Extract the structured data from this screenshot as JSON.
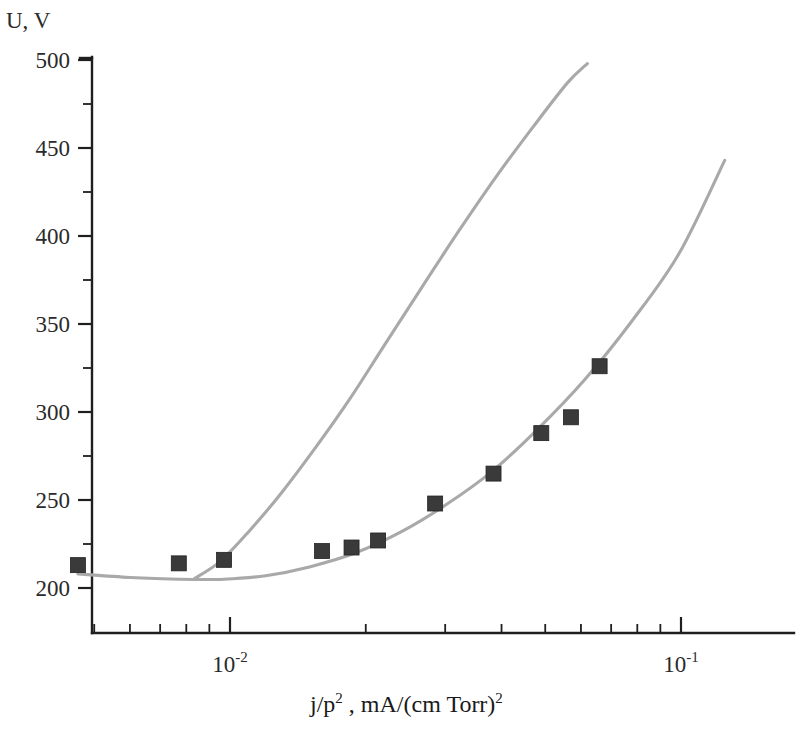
{
  "chart_data": {
    "type": "scatter",
    "title": "",
    "subtitle": "",
    "xlabel": "j/p² , mA/(cm Torr)²",
    "ylabel": "U, V",
    "xscale": "log",
    "yscale": "linear",
    "xlim": [
      0.0045,
      0.145
    ],
    "ylim": [
      175,
      500
    ],
    "grid": false,
    "legend": "none",
    "y_ticks": [
      200,
      250,
      300,
      350,
      400,
      450,
      500
    ],
    "y_tick_labels": [
      "200",
      "250",
      "300",
      "350",
      "400",
      "450",
      "500"
    ],
    "y_minor_ticks": [
      225,
      275,
      325,
      375,
      425,
      475
    ],
    "x_ticks": [
      0.01,
      0.1
    ],
    "x_tick_labels": [
      "10⁻²",
      "10⁻¹"
    ],
    "x_tick_label_bases": [
      "10",
      "10"
    ],
    "x_tick_label_exponents": [
      "-2",
      "-1"
    ],
    "x_minor_ticks": [
      0.005,
      0.006,
      0.007,
      0.008,
      0.009,
      0.02,
      0.03,
      0.04,
      0.05,
      0.06,
      0.07,
      0.08,
      0.09
    ],
    "series": [
      {
        "name": "experimental-points",
        "type": "scatter",
        "marker": "square",
        "color": "#3a3a3a",
        "x": [
          0.0046,
          0.0077,
          0.0097,
          0.016,
          0.0186,
          0.0213,
          0.0285,
          0.0384,
          0.049,
          0.057,
          0.066
        ],
        "y": [
          213,
          214,
          216,
          221,
          223,
          227,
          248,
          265,
          288,
          297,
          326
        ]
      },
      {
        "name": "upper-curve",
        "type": "line",
        "color": "#a9a9a9",
        "x": [
          0.0083,
          0.0095,
          0.011,
          0.013,
          0.0155,
          0.0185,
          0.022,
          0.0265,
          0.032,
          0.039,
          0.047,
          0.056,
          0.062
        ],
        "y": [
          205,
          215,
          232,
          254,
          280,
          308,
          338,
          370,
          402,
          434,
          462,
          487,
          498
        ]
      },
      {
        "name": "lower-curve",
        "type": "line",
        "color": "#a9a9a9",
        "x": [
          0.0046,
          0.006,
          0.0077,
          0.0097,
          0.012,
          0.015,
          0.019,
          0.024,
          0.03,
          0.038,
          0.048,
          0.061,
          0.078,
          0.099,
          0.125
        ],
        "y": [
          208,
          206,
          205,
          205,
          207,
          212,
          220,
          232,
          247,
          266,
          290,
          318,
          352,
          390,
          443
        ]
      }
    ]
  },
  "axes": {
    "y_axis_caption": "U, V",
    "x_axis_caption_parts": {
      "j_over_p": "j/p",
      "p_exp": "2",
      "mid": " , mA/(cm Torr)",
      "tail_exp": "2"
    }
  }
}
